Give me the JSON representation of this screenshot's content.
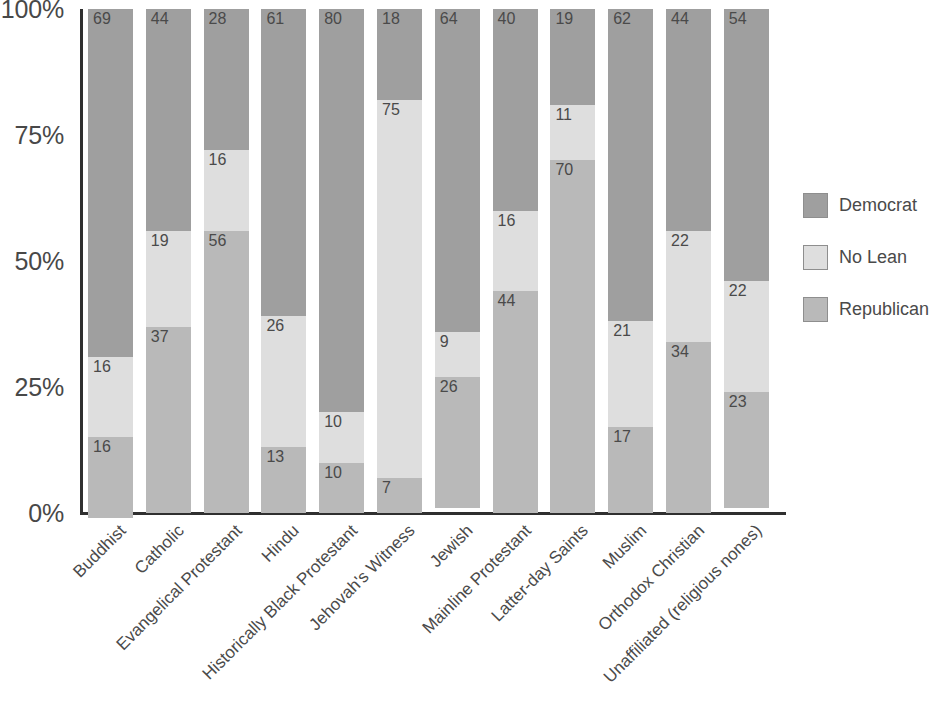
{
  "chart_data": {
    "type": "bar",
    "subtype": "stacked-100-percent",
    "title": "",
    "xlabel": "",
    "ylabel": "",
    "ylim": [
      0,
      100
    ],
    "ytick_labels": [
      "100%",
      "75%",
      "50%",
      "25%",
      "0%"
    ],
    "ytick_values": [
      100,
      75,
      50,
      25,
      0
    ],
    "grid": false,
    "legend_position": "right",
    "categories": [
      "Buddhist",
      "Catholic",
      "Evangelical Protestant",
      "Hindu",
      "Historically Black Protestant",
      "Jehovah's Witness",
      "Jewish",
      "Mainline Protestant",
      "Latter-day Saints",
      "Muslim",
      "Orthodox Christian",
      "Unaffiliated (religious nones)"
    ],
    "series": [
      {
        "name": "Democrat",
        "color": "#9f9f9f",
        "values": [
          69,
          44,
          28,
          61,
          80,
          18,
          64,
          40,
          19,
          62,
          44,
          54
        ]
      },
      {
        "name": "No Lean",
        "color": "#dedede",
        "values": [
          16,
          19,
          16,
          26,
          10,
          75,
          9,
          16,
          11,
          21,
          22,
          22
        ]
      },
      {
        "name": "Republican",
        "color": "#b9b9b9",
        "values": [
          16,
          37,
          56,
          13,
          10,
          7,
          26,
          44,
          70,
          17,
          34,
          23
        ]
      }
    ]
  },
  "legend": {
    "items": [
      {
        "label": "Democrat",
        "color": "#9f9f9f"
      },
      {
        "label": "No Lean",
        "color": "#dedede"
      },
      {
        "label": "Republican",
        "color": "#b9b9b9"
      }
    ]
  }
}
